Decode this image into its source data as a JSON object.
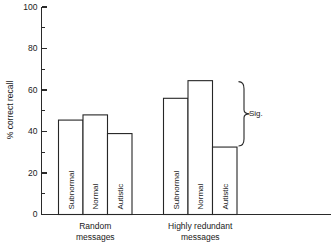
{
  "chart_data": {
    "type": "bar",
    "title": "",
    "subtitle": "",
    "xlabel": "",
    "ylabel": "% correct recall",
    "ylim": [
      0,
      100
    ],
    "grid": false,
    "legend_position": "none",
    "y_ticks_major": [
      0,
      20,
      40,
      60,
      80,
      100
    ],
    "y_ticks_minor": [
      10,
      30,
      50,
      70,
      90
    ],
    "y_tick_labels": [
      "0",
      "20",
      "40",
      "60",
      "80",
      "100"
    ],
    "categories": [
      "Random messages",
      "Highly redundant messages"
    ],
    "category_lines": [
      [
        "Random",
        "messages"
      ],
      [
        "Highly redundant",
        "messages"
      ]
    ],
    "series": [
      {
        "name": "Subnormal",
        "values": [
          45.5,
          56
        ]
      },
      {
        "name": "Normal",
        "values": [
          48,
          64.5
        ]
      },
      {
        "name": "Autistic",
        "values": [
          39,
          32.5
        ]
      }
    ],
    "bars": [
      {
        "group": "Random messages",
        "label": "Subnormal",
        "value": 45.5
      },
      {
        "group": "Random messages",
        "label": "Normal",
        "value": 48
      },
      {
        "group": "Random messages",
        "label": "Autistic",
        "value": 39
      },
      {
        "group": "Highly redundant messages",
        "label": "Subnormal",
        "value": 56
      },
      {
        "group": "Highly redundant messages",
        "label": "Normal",
        "value": 64.5
      },
      {
        "group": "Highly redundant messages",
        "label": "Autistic",
        "value": 32.5
      }
    ],
    "annotations": [
      {
        "text": "Sig.",
        "type": "brace",
        "group": "Highly redundant messages",
        "spans": [
          "Normal",
          "Autistic"
        ],
        "from_value": 64.5,
        "to_value": 32.5
      }
    ],
    "colors": {
      "bar_fill": "#ffffff",
      "bar_stroke": "#262626",
      "axis": "#2a2a2a",
      "text": "#1a1a1a",
      "background": "#ffffff"
    }
  }
}
